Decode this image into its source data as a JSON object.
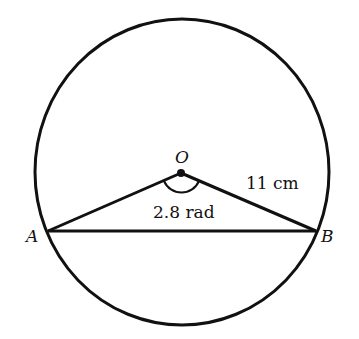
{
  "diagram": {
    "points": {
      "O": {
        "label": "O",
        "x": 181,
        "y": 173
      },
      "A": {
        "label": "A",
        "x": 48,
        "y": 231
      },
      "B": {
        "label": "B",
        "x": 316,
        "y": 231
      }
    },
    "circle": {
      "cx": 182,
      "cy": 172,
      "rx": 147,
      "ry": 153
    },
    "labels": {
      "angle": "2.8 rad",
      "radius": "11 cm",
      "O": "O",
      "A": "A",
      "B": "B"
    },
    "colors": {
      "stroke": "#111111",
      "background": "#ffffff"
    }
  }
}
